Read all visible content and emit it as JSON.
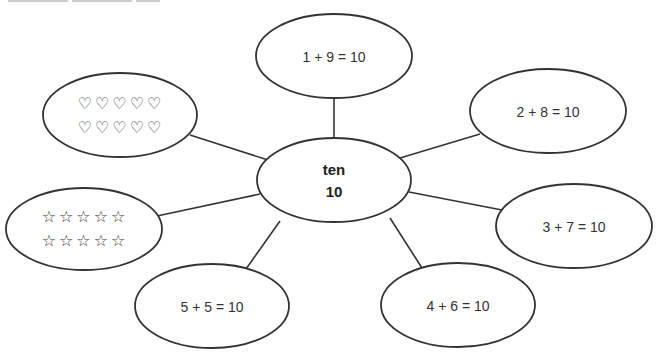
{
  "diagram": {
    "type": "concept-map",
    "stroke_color": "#333333",
    "center": {
      "word": "ten",
      "number": "10"
    },
    "nodes": [
      {
        "id": "top",
        "label": "1 + 9 = 10"
      },
      {
        "id": "right-top",
        "label": "2 + 8 = 10"
      },
      {
        "id": "right-middle",
        "label": "3 + 7 = 10"
      },
      {
        "id": "bottom-right",
        "label": "4 + 6 = 10"
      },
      {
        "id": "bottom-left",
        "label": "5 + 5 = 10"
      }
    ],
    "hearts": {
      "icon": "heart-outline-icon",
      "row1": "♡♡♡♡♡",
      "row2": "♡♡♡♡♡",
      "count": 10
    },
    "stars": {
      "icon": "star-outline-icon",
      "row1": "☆☆☆☆☆",
      "row2": "☆☆☆☆☆",
      "count": 10
    }
  }
}
